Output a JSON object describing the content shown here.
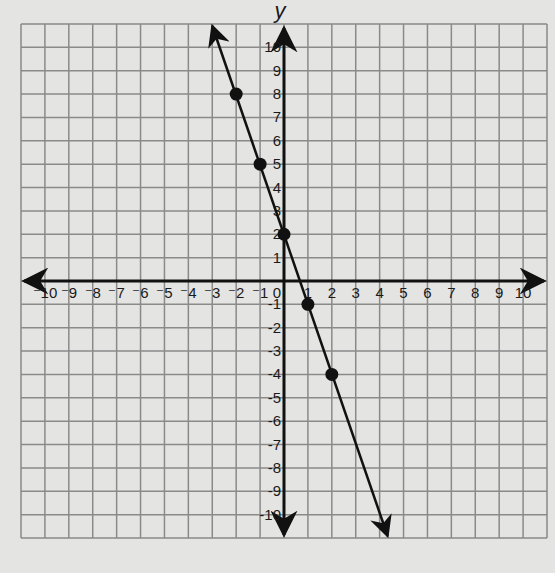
{
  "chart_data": {
    "type": "line",
    "title": "",
    "xlabel": "x",
    "ylabel": "y",
    "xlim": [
      -11,
      11
    ],
    "ylim": [
      -11,
      11
    ],
    "grid": true,
    "x_ticks": [
      -10,
      -9,
      -8,
      -7,
      -6,
      -5,
      -4,
      -3,
      -2,
      -1,
      1,
      2,
      3,
      4,
      5,
      6,
      7,
      8,
      9,
      10
    ],
    "y_ticks": [
      -10,
      -9,
      -8,
      -7,
      -6,
      -5,
      -4,
      -3,
      -2,
      -1,
      1,
      2,
      3,
      4,
      5,
      6,
      7,
      8,
      9,
      10
    ],
    "origin_label": "0",
    "line": {
      "slope": -3,
      "intercept": 2,
      "equation": "y = -3x + 2",
      "arrows": "both"
    },
    "points": [
      {
        "x": -2,
        "y": 8
      },
      {
        "x": -1,
        "y": 5
      },
      {
        "x": 0,
        "y": 2
      },
      {
        "x": 1,
        "y": -1
      },
      {
        "x": 2,
        "y": -4
      }
    ],
    "colors": {
      "background": "#e4e4e2",
      "grid": "#8a8a8a",
      "axis": "#111111",
      "line": "#111111",
      "point": "#111111"
    }
  }
}
